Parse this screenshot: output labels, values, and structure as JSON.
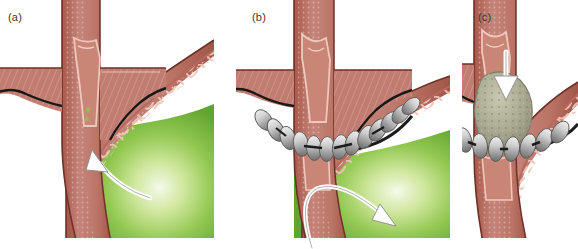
{
  "figure": {
    "background_color": "#ffffff",
    "panel_count": 3
  },
  "palette": {
    "muscle_outer": "#bd7a6d",
    "muscle_dark": "#a8584c",
    "muscle_mid": "#c78377",
    "mucosa_light": "#e3b3a8",
    "mucosa_pink": "#d8a195",
    "rugae_line": "#edc4b9",
    "submucosa_dot": "#f0d2c8",
    "outline_dark": "#5d2b22",
    "serosa_black": "#181818",
    "acid_green_edge": "#63a832",
    "acid_green_mid": "#8cc63f",
    "acid_green_core": "#f2f8e6",
    "bead_light": "#e2e2e2",
    "bead_mid": "#b4b4b4",
    "bead_dark": "#6e6e6e",
    "bead_wire": "#1c1c1c",
    "bolus_fill": "#a9a992",
    "bolus_speckle": "#8d8d76",
    "arrow_white": "#ffffff",
    "arrow_outline": "#6b6b6b",
    "label_text": "#3a3a3a"
  },
  "panels": [
    {
      "id": "a",
      "label": "(a)",
      "caption_state": "reflux",
      "structures": [
        "oesophagus",
        "oesophageal-mucosa",
        "diaphragm-crus-left",
        "diaphragm-crus-right",
        "gastro-oesophageal-junction",
        "gastric-fundus",
        "gastric-rugae",
        "gastric-contents"
      ],
      "device_present": false,
      "bead_count": 0,
      "bolus_present": false,
      "arrow": {
        "name": "reflux-arrow",
        "direction": "upward-curving-left",
        "meaning": "gastric contents reflux up into the oesophagus",
        "color": "#ffffff"
      }
    },
    {
      "id": "b",
      "label": "(b)",
      "caption_state": "reflux-prevented",
      "structures": [
        "oesophagus",
        "oesophageal-mucosa",
        "diaphragm-crus-left",
        "diaphragm-crus-right",
        "gastro-oesophageal-junction",
        "gastric-fundus",
        "gastric-rugae",
        "gastric-contents",
        "magnetic-bead-ring"
      ],
      "device_present": true,
      "bead_count": 13,
      "bead_state": "closed",
      "bolus_present": false,
      "arrow": {
        "name": "deflected-reflux-arrow",
        "direction": "up-then-back-down-right",
        "meaning": "reflux is blocked and deflected back into the stomach",
        "color": "#ffffff"
      }
    },
    {
      "id": "c",
      "label": "(c)",
      "caption_state": "swallowing-bolus-passes",
      "structures": [
        "oesophagus",
        "oesophageal-mucosa",
        "diaphragm-crus-left",
        "gastro-oesophageal-junction",
        "gastric-fundus",
        "gastric-rugae",
        "magnetic-bead-ring",
        "food-bolus"
      ],
      "device_present": true,
      "bead_count": 9,
      "bead_state": "open-expanded",
      "bolus_present": true,
      "arrow": {
        "name": "swallow-arrow",
        "direction": "downward",
        "meaning": "swallowed bolus pushes the beads apart and passes through",
        "color": "#ffffff"
      }
    }
  ]
}
